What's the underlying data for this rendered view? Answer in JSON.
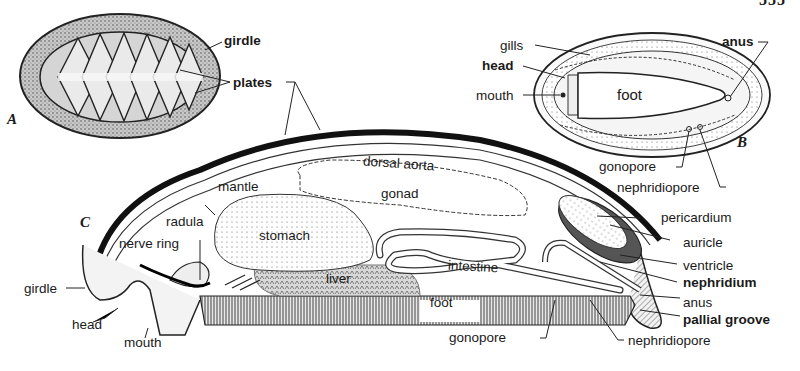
{
  "figure": {
    "page_number_fragment": "555",
    "panels": {
      "A": {
        "letter": "A",
        "description": "dorsal view of chiton",
        "labels": {
          "girdle": "girdle",
          "plates": "plates"
        }
      },
      "B": {
        "letter": "B",
        "description": "ventral view of chiton",
        "labels": {
          "gills": "gills",
          "head": "head",
          "mouth": "mouth",
          "foot": "foot",
          "anus": "anus",
          "gonopore": "gonopore",
          "nephridiopore": "nephridiopore"
        }
      },
      "C": {
        "letter": "C",
        "description": "longitudinal section of chiton",
        "labels": {
          "mantle": "mantle",
          "dorsal_aorta": "dorsal aorta",
          "gonad": "gonad",
          "radula": "radula",
          "nerve_ring": "nerve ring",
          "stomach": "stomach",
          "liver": "liver",
          "intestine": "intestine",
          "foot": "foot",
          "girdle": "girdle",
          "head": "head",
          "mouth": "mouth",
          "gonopore": "gonopore",
          "nephridiopore": "nephridiopore",
          "pericardium": "pericardium",
          "auricle": "auricle",
          "ventricle": "ventricle",
          "nephridium": "nephridium",
          "anus": "anus",
          "pallial_groove": "pallial groove"
        }
      }
    }
  }
}
